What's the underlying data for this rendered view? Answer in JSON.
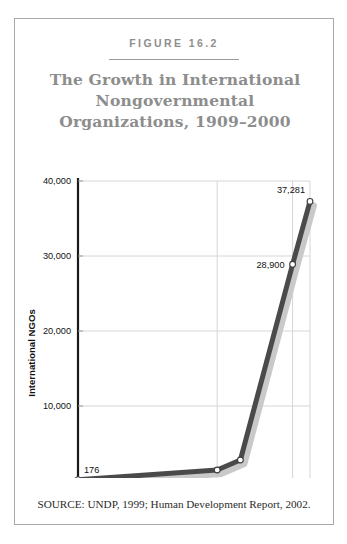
{
  "figure": {
    "number_label": "FIGURE 16.2",
    "title_lines": [
      "The Growth in International",
      "Nongovernmental",
      "Organizations, 1909–2000"
    ],
    "source": "SOURCE:  UNDP, 1999; Human Development Report, 2002."
  },
  "colors": {
    "title": "#8d8d8d",
    "figure_number": "#8e8e8e",
    "line": "#4a4a4a",
    "line_shadow": "#c9c9c9",
    "gridline": "#d6d6d6",
    "axis": "#1a1a1a",
    "frame": "#a8a8a8",
    "text": "#1a1a1a",
    "marker_fill": "#ffffff"
  },
  "chart_data": {
    "type": "line",
    "title": "The Growth in International Nongovernmental Organizations, 1909–2000",
    "xlabel": "",
    "ylabel": "International NGOs",
    "ylim": [
      0,
      40000
    ],
    "yticks": [
      0,
      10000,
      20000,
      30000,
      40000
    ],
    "ytick_labels": [
      "0",
      "10,000",
      "20,000",
      "30,000",
      "40,000"
    ],
    "xtick_labels": [
      "1909",
      "1964",
      "1993",
      "2000"
    ],
    "grid": "horizontal-and-vertical",
    "legend": "none",
    "series": [
      {
        "name": "International NGOs",
        "points": [
          {
            "x_label": "1909",
            "x_pos": 0.0,
            "value": 176,
            "data_label": "176"
          },
          {
            "x_label": "1964",
            "x_pos": 0.6,
            "value": 1470,
            "data_label": ""
          },
          {
            "x_label": "",
            "x_pos": 0.7,
            "value": 2800,
            "data_label": ""
          },
          {
            "x_label": "1993",
            "x_pos": 0.925,
            "value": 28900,
            "data_label": "28,900"
          },
          {
            "x_label": "2000",
            "x_pos": 1.0,
            "value": 37281,
            "data_label": "37,281"
          }
        ]
      }
    ],
    "annotations": [
      {
        "text": "176",
        "near": "1909"
      },
      {
        "text": "28,900",
        "near": "1993"
      },
      {
        "text": "37,281",
        "near": "2000"
      }
    ]
  }
}
